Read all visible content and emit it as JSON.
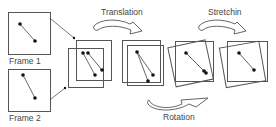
{
  "diagram": {
    "type": "image-registration-pipeline",
    "labels": {
      "frame1": "Frame 1",
      "frame2": "Frame 2",
      "translation": "Translation",
      "stretching": "Stretchin",
      "rotation": "Rotation"
    },
    "stages": [
      {
        "name": "input-frames",
        "description": "Two separate frames, each with two points joined by a line"
      },
      {
        "name": "overlay",
        "description": "Frames overlaid, offset from each other"
      },
      {
        "name": "translation",
        "description": "Frames aligned after translation"
      },
      {
        "name": "rotation",
        "description": "One frame rotated to align line segments"
      },
      {
        "name": "stretching",
        "description": "Frame stretched to match"
      }
    ],
    "colors": {
      "line": "#555555",
      "dot": "#111111",
      "text": "#444444",
      "background": "#ffffff"
    }
  }
}
